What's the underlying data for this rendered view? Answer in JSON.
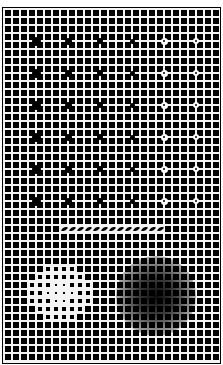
{
  "figure": {
    "title": "Grid illusion with dots, slanted row and brightness gradients",
    "colors": {
      "background": "#f4f4f4",
      "square": "#000000",
      "line": "#f4f4f4",
      "frame": "#000000"
    }
  },
  "grid": {
    "cols": 27,
    "rows": 44,
    "pitch": 8,
    "square": 6,
    "offset_x": 2,
    "offset_y": 2
  },
  "dots": {
    "columns": [
      {
        "col": 4,
        "style": "black",
        "radius": 4.5
      },
      {
        "col": 8,
        "style": "black",
        "radius": 3.5
      },
      {
        "col": 12,
        "style": "black",
        "radius": 3
      },
      {
        "col": 16,
        "style": "black",
        "radius": 2.5
      },
      {
        "col": 20,
        "style": "halo",
        "radius": 1.4,
        "halo_radius": 3.5
      },
      {
        "col": 24,
        "style": "halo",
        "radius": 1.2,
        "halo_radius": 3.2
      }
    ],
    "rows": [
      4,
      8,
      12,
      16,
      20,
      24
    ]
  },
  "slanted_row": {
    "row": 27,
    "col_start": 7,
    "col_end": 19
  },
  "gradients": [
    {
      "name": "white-glow",
      "cx": 60,
      "cy": 293,
      "r": 38,
      "color": "rgba(255,255,255,1)"
    },
    {
      "name": "dark-glow",
      "cx": 156,
      "cy": 297,
      "r": 40,
      "color": "rgba(0,0,0,1)"
    }
  ]
}
